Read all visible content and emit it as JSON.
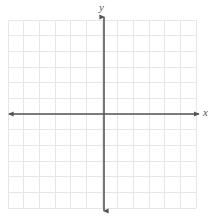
{
  "figure": {
    "type": "coordinate-plane",
    "title": "",
    "background_color": "#ffffff"
  },
  "grid": {
    "columns": 12,
    "rows": 12,
    "cell_size_px": 15.67,
    "left_px": 8,
    "top_px": 20,
    "width_px": 188,
    "height_px": 188,
    "line_color": "#e6e6e6",
    "line_width_px": 1
  },
  "axes": {
    "color": "#555555",
    "line_width_px": 1.6,
    "origin": {
      "x_px": 104,
      "y_px": 114
    },
    "x_axis": {
      "label": "x",
      "start_px": 9,
      "end_px": 199,
      "y_px": 114,
      "arrow_start": true,
      "arrow_end": true
    },
    "y_axis": {
      "label": "y",
      "start_px": 17,
      "end_px": 211,
      "x_px": 104,
      "arrow_start": true,
      "arrow_end": true
    },
    "tick_labels": [],
    "numbers_shown": false
  },
  "chart_data": {
    "type": "scatter",
    "title": "",
    "xlabel": "x",
    "ylabel": "y",
    "xlim": [
      -6,
      6
    ],
    "ylim": [
      -6,
      6
    ],
    "grid": true,
    "legend": null,
    "series": [],
    "annotations": []
  }
}
